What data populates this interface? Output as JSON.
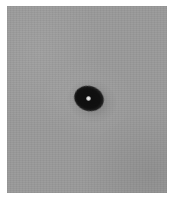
{
  "image": {
    "description": "Grayscale microscopy image of a single dark round particle with a bright central spot on a uniform gray background",
    "background_color": "#999999",
    "border_color": "#ffffff",
    "particle": {
      "color": "#101010",
      "core_color": "#f0f0f0",
      "shape": "ellipse"
    }
  }
}
